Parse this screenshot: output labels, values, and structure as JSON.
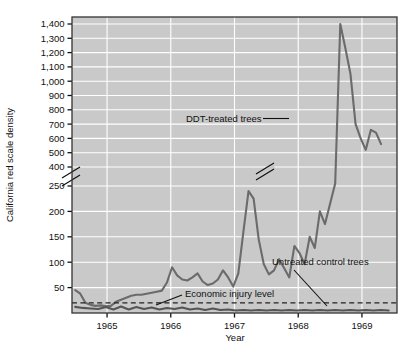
{
  "chart_data": {
    "type": "line",
    "title": "",
    "xlabel": "Year",
    "ylabel": "California red scale density",
    "grid": true,
    "legend_position": "inline-annotations",
    "plot_background": "#c9c9c9",
    "gridline_color": "#ffffff",
    "line_color": "#6b6b6b",
    "reference_line_color": "#333333",
    "x_tick_labels": [
      "1965",
      "1966",
      "1967",
      "1968",
      "1969"
    ],
    "x_tick_values": [
      1965,
      1966,
      1967,
      1968,
      1969
    ],
    "xlim": [
      1964.45,
      1969.55
    ],
    "y_axis_broken": true,
    "y_break_between": [
      250,
      400
    ],
    "y_tick_labels_upper": [
      "1,400",
      "1,300",
      "1,200",
      "1,100",
      "1,000",
      "900",
      "800",
      "700",
      "600",
      "500",
      "400"
    ],
    "y_tick_values_upper": [
      1400,
      1300,
      1200,
      1100,
      1000,
      900,
      800,
      700,
      600,
      500,
      400
    ],
    "y_tick_labels_lower": [
      "250",
      "200",
      "150",
      "100",
      "50"
    ],
    "y_tick_values_lower": [
      250,
      200,
      150,
      100,
      50
    ],
    "ylim_lower_segment": [
      0,
      250
    ],
    "ylim_upper_segment": [
      400,
      1450
    ],
    "annotations": [
      {
        "name": "ddt-treated-trees",
        "text": "DDT-treated trees",
        "leader": "horizontal-right"
      },
      {
        "name": "untreated-control-trees",
        "text": "Untreated control trees",
        "leader": "diagonal-down-right"
      },
      {
        "name": "economic-injury-level",
        "text": "Economic injury level",
        "leader": "diagonal-down-left"
      }
    ],
    "reference_lines": [
      {
        "name": "economic-injury-level",
        "value": 20,
        "style": "dashed"
      }
    ],
    "series": [
      {
        "name": "DDT-treated trees",
        "style": "solid",
        "has_axis_break_marker": true,
        "x": [
          1964.5,
          1964.58,
          1964.66,
          1964.74,
          1964.82,
          1964.9,
          1964.98,
          1965.06,
          1965.14,
          1965.22,
          1965.3,
          1965.38,
          1965.46,
          1965.54,
          1965.62,
          1965.7,
          1965.78,
          1965.86,
          1965.94,
          1966.02,
          1966.1,
          1966.18,
          1966.26,
          1966.34,
          1966.42,
          1966.5,
          1966.58,
          1966.66,
          1966.74,
          1966.82,
          1966.9,
          1966.98,
          1967.06,
          1967.14,
          1967.22,
          1967.3,
          1967.38,
          1967.46,
          1967.54,
          1967.62,
          1967.7,
          1967.78,
          1967.86,
          1967.94,
          1968.02,
          1968.1,
          1968.18,
          1968.26,
          1968.34,
          1968.42,
          1968.5,
          1968.58,
          1968.66,
          1968.74,
          1968.82,
          1968.9,
          1968.98,
          1969.06,
          1969.14,
          1969.22,
          1969.3
        ],
        "y": [
          45,
          38,
          20,
          16,
          14,
          15,
          13,
          14,
          22,
          26,
          30,
          34,
          36,
          36,
          38,
          40,
          42,
          44,
          60,
          90,
          74,
          66,
          64,
          70,
          78,
          62,
          55,
          58,
          66,
          84,
          70,
          52,
          78,
          160,
          240,
          225,
          145,
          96,
          76,
          84,
          106,
          88,
          70,
          132,
          118,
          96,
          150,
          128,
          200,
          175,
          215,
          270,
          1400,
          1230,
          1050,
          700,
          600,
          520,
          660,
          640,
          560
        ],
        "note": "values beyond the axis break (above 400) are plotted on the compressed upper segment"
      },
      {
        "name": "Untreated control trees",
        "style": "solid",
        "x": [
          1964.5,
          1964.62,
          1964.74,
          1964.86,
          1964.98,
          1965.1,
          1965.22,
          1965.34,
          1965.46,
          1965.58,
          1965.7,
          1965.82,
          1965.94,
          1966.06,
          1966.18,
          1966.3,
          1966.42,
          1966.54,
          1966.66,
          1966.78,
          1966.9,
          1967.02,
          1967.14,
          1967.26,
          1967.38,
          1967.5,
          1967.62,
          1967.74,
          1967.86,
          1967.98,
          1968.1,
          1968.22,
          1968.34,
          1968.46,
          1968.58,
          1968.7,
          1968.82,
          1968.94,
          1969.06,
          1969.18,
          1969.3,
          1969.42
        ],
        "y": [
          12,
          10,
          9,
          8,
          12,
          7,
          13,
          7,
          12,
          8,
          11,
          7,
          10,
          8,
          11,
          7,
          9,
          6,
          9,
          6,
          7,
          5,
          6,
          5,
          6,
          5,
          6,
          5,
          6,
          5,
          6,
          5,
          6,
          5,
          6,
          5,
          6,
          5,
          6,
          5,
          6,
          5
        ]
      }
    ]
  }
}
